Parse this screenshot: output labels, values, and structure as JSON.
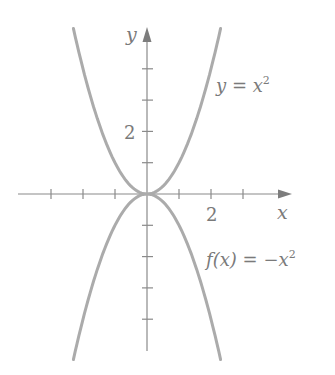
{
  "chart_data": {
    "type": "line",
    "title": "",
    "xlabel": "x",
    "ylabel": "y",
    "xlim": [
      -3,
      4
    ],
    "ylim": [
      -5,
      5
    ],
    "x_ticks": [
      -3,
      -2,
      -1,
      1,
      2,
      3
    ],
    "y_ticks": [
      -4,
      -3,
      -2,
      -1,
      1,
      2,
      3,
      4
    ],
    "x_tick_labels": [
      {
        "value": 2,
        "label": "2"
      }
    ],
    "y_tick_labels": [
      {
        "value": 2,
        "label": "2"
      }
    ],
    "grid": false,
    "series": [
      {
        "name": "y = x^2",
        "label": "y = x²",
        "expression": "x^2",
        "x_range": [
          -2.3,
          2.3
        ],
        "x": [
          -2.3,
          -2,
          -1.5,
          -1,
          -0.5,
          0,
          0.5,
          1,
          1.5,
          2,
          2.3
        ],
        "values": [
          5.29,
          4,
          2.25,
          1,
          0.25,
          0,
          0.25,
          1,
          2.25,
          4,
          5.29
        ]
      },
      {
        "name": "f(x) = -x^2",
        "label": "f(x) = −x²",
        "expression": "-x^2",
        "x_range": [
          -2.3,
          2.3
        ],
        "x": [
          -2.3,
          -2,
          -1.5,
          -1,
          -0.5,
          0,
          0.5,
          1,
          1.5,
          2,
          2.3
        ],
        "values": [
          -5.29,
          -4,
          -2.25,
          -1,
          -0.25,
          0,
          -0.25,
          -1,
          -2.25,
          -4,
          -5.29
        ]
      }
    ],
    "annotations": [
      {
        "text": "y = x²",
        "near_series": 0
      },
      {
        "text": "f(x) = −x²",
        "near_series": 1
      }
    ]
  },
  "labels": {
    "y_axis": "y",
    "x_axis": "x",
    "x_tick_2": "2",
    "y_tick_2": "2",
    "upper_curve": {
      "lhs": "y",
      "eq": " = ",
      "rhs": "x",
      "exp": "2"
    },
    "lower_curve": {
      "lhs": "f(x)",
      "eq": " = ",
      "rhs": "−x",
      "exp": "2"
    }
  },
  "colors": {
    "curve": "#ababab",
    "axis": "#8a8a8a",
    "text": "#7a7a7a"
  }
}
